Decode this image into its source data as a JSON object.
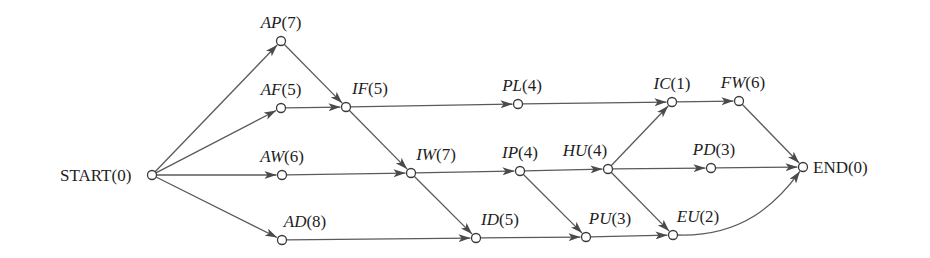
{
  "diagram": {
    "type": "activity-network (critical path)",
    "colors": {
      "edge": "#5a5a5a",
      "node_stroke": "#3a3a3a",
      "text": "#1e1e1e",
      "background": "#ffffff"
    },
    "nodes": [
      {
        "id": "START",
        "name": "START",
        "duration": "(0)",
        "italic": false,
        "x": 152,
        "y": 175,
        "label_x": 60,
        "label_y": 181,
        "anchor": "start"
      },
      {
        "id": "AP",
        "name": "AP",
        "duration": "(7)",
        "italic": true,
        "x": 281,
        "y": 41,
        "label_x": 281,
        "label_y": 28,
        "anchor": "middle"
      },
      {
        "id": "AF",
        "name": "AF",
        "duration": "(5)",
        "italic": true,
        "x": 281,
        "y": 108,
        "label_x": 281,
        "label_y": 95,
        "anchor": "middle"
      },
      {
        "id": "AW",
        "name": "AW",
        "duration": "(6)",
        "italic": true,
        "x": 282,
        "y": 175,
        "label_x": 282,
        "label_y": 162,
        "anchor": "middle"
      },
      {
        "id": "AD",
        "name": "AD",
        "duration": "(8)",
        "italic": true,
        "x": 282,
        "y": 240,
        "label_x": 305,
        "label_y": 227,
        "anchor": "middle"
      },
      {
        "id": "IF",
        "name": "IF",
        "duration": "(5)",
        "italic": true,
        "x": 346,
        "y": 107,
        "label_x": 370,
        "label_y": 94,
        "anchor": "middle"
      },
      {
        "id": "PL",
        "name": "PL",
        "duration": "(4)",
        "italic": true,
        "x": 518,
        "y": 104,
        "label_x": 522,
        "label_y": 91,
        "anchor": "middle"
      },
      {
        "id": "IW",
        "name": "IW",
        "duration": "(7)",
        "italic": true,
        "x": 411,
        "y": 173,
        "label_x": 436,
        "label_y": 160,
        "anchor": "middle"
      },
      {
        "id": "IP",
        "name": "IP",
        "duration": "(4)",
        "italic": true,
        "x": 520,
        "y": 171,
        "label_x": 520,
        "label_y": 158,
        "anchor": "middle"
      },
      {
        "id": "HU",
        "name": "HU",
        "duration": "(4)",
        "italic": true,
        "x": 608,
        "y": 169,
        "label_x": 585,
        "label_y": 156,
        "anchor": "middle"
      },
      {
        "id": "ID",
        "name": "ID",
        "duration": "(5)",
        "italic": true,
        "x": 476,
        "y": 238,
        "label_x": 500,
        "label_y": 225,
        "anchor": "middle"
      },
      {
        "id": "PU",
        "name": "PU",
        "duration": "(3)",
        "italic": true,
        "x": 586,
        "y": 237,
        "label_x": 610,
        "label_y": 224,
        "anchor": "middle"
      },
      {
        "id": "IC",
        "name": "IC",
        "duration": "(1)",
        "italic": true,
        "x": 672,
        "y": 102,
        "label_x": 672,
        "label_y": 89,
        "anchor": "middle"
      },
      {
        "id": "FW",
        "name": "FW",
        "duration": "(6)",
        "italic": true,
        "x": 739,
        "y": 101,
        "label_x": 743,
        "label_y": 88,
        "anchor": "middle"
      },
      {
        "id": "PD",
        "name": "PD",
        "duration": "(3)",
        "italic": true,
        "x": 711,
        "y": 168,
        "label_x": 714,
        "label_y": 155,
        "anchor": "middle"
      },
      {
        "id": "EU",
        "name": "EU",
        "duration": "(2)",
        "italic": true,
        "x": 673,
        "y": 235,
        "label_x": 698,
        "label_y": 222,
        "anchor": "middle"
      },
      {
        "id": "END",
        "name": "END",
        "duration": "(0)",
        "italic": false,
        "x": 803,
        "y": 167,
        "label_x": 813,
        "label_y": 173,
        "anchor": "start"
      }
    ],
    "edges": [
      {
        "from": "START",
        "to": "AP"
      },
      {
        "from": "START",
        "to": "AF"
      },
      {
        "from": "START",
        "to": "AW"
      },
      {
        "from": "START",
        "to": "AD"
      },
      {
        "from": "AP",
        "to": "IF"
      },
      {
        "from": "AF",
        "to": "IF"
      },
      {
        "from": "IF",
        "to": "PL"
      },
      {
        "from": "IF",
        "to": "IW"
      },
      {
        "from": "AW",
        "to": "IW"
      },
      {
        "from": "AD",
        "to": "ID"
      },
      {
        "from": "IW",
        "to": "IP"
      },
      {
        "from": "IW",
        "to": "ID"
      },
      {
        "from": "PL",
        "to": "IC"
      },
      {
        "from": "IP",
        "to": "HU"
      },
      {
        "from": "IP",
        "to": "PU"
      },
      {
        "from": "ID",
        "to": "PU"
      },
      {
        "from": "HU",
        "to": "IC"
      },
      {
        "from": "HU",
        "to": "PD"
      },
      {
        "from": "HU",
        "to": "EU"
      },
      {
        "from": "PU",
        "to": "EU"
      },
      {
        "from": "IC",
        "to": "FW"
      },
      {
        "from": "FW",
        "to": "END"
      },
      {
        "from": "PD",
        "to": "END"
      },
      {
        "from": "EU",
        "to": "END",
        "curved": true
      }
    ]
  }
}
